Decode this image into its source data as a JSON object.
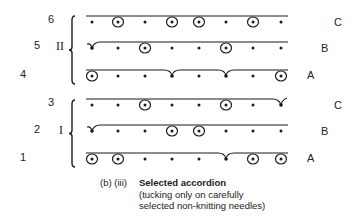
{
  "diagram": {
    "needle_x": [
      92,
      118,
      145,
      172,
      199,
      226,
      253,
      281
    ],
    "line_x_start": 86,
    "line_x_end": 288,
    "groups": [
      {
        "name": "II",
        "brace_top": 16,
        "brace_bottom": 84,
        "brace_x": 72,
        "label_y": 41,
        "rows": [
          {
            "number": "6",
            "number_x": 48,
            "course": "C",
            "course_x": 337,
            "y": 22,
            "needles": [
              "dot",
              "circle",
              "dot",
              "circle",
              "circle",
              "dot",
              "circle",
              "dot"
            ]
          },
          {
            "number": "5",
            "number_x": 34,
            "course": "B",
            "course_x": 324,
            "y": 48,
            "needles": [
              "tuck",
              "dot",
              "circle",
              "dot",
              "dot",
              "circle",
              "dot",
              "dot"
            ]
          },
          {
            "number": "4",
            "number_x": 20,
            "course": "A",
            "course_x": 310,
            "y": 76,
            "needles": [
              "circle",
              "dot",
              "dot",
              "tuck",
              "dot",
              "tuck",
              "dot",
              "circle"
            ]
          }
        ]
      },
      {
        "name": "I",
        "brace_top": 100,
        "brace_bottom": 167,
        "brace_x": 72,
        "label_y": 124,
        "rows": [
          {
            "number": "3",
            "number_x": 48,
            "course": "C",
            "course_x": 337,
            "y": 105,
            "needles": [
              "dot",
              "dot",
              "circle",
              "dot",
              "dot",
              "circle",
              "dot",
              "tuck"
            ]
          },
          {
            "number": "2",
            "number_x": 34,
            "course": "B",
            "course_x": 324,
            "y": 131,
            "needles": [
              "tuck",
              "dot",
              "dot",
              "circle",
              "circle",
              "dot",
              "dot",
              "dot"
            ]
          },
          {
            "number": "1",
            "number_x": 20,
            "course": "A",
            "course_x": 310,
            "y": 159,
            "needles": [
              "circle",
              "circle",
              "dot",
              "dot",
              "dot",
              "tuck",
              "circle",
              "circle"
            ]
          }
        ]
      }
    ]
  },
  "labels": {
    "row_6": "6",
    "row_5": "5",
    "row_4": "4",
    "row_3": "3",
    "row_2": "2",
    "row_1": "1",
    "group_II": "II",
    "group_I": "I",
    "course_C_top": "C",
    "course_B_top": "B",
    "course_A_top": "A",
    "course_C_bottom": "C",
    "course_B_bottom": "B",
    "course_A_bottom": "A"
  },
  "caption": {
    "prefix": "(b) (iii)",
    "title": "Selected accordion",
    "line2": "(tucking only on carefully",
    "line3": "selected non-knitting needles)"
  },
  "colors": {
    "ink": "#1a1a1a",
    "background": "#ffffff"
  }
}
